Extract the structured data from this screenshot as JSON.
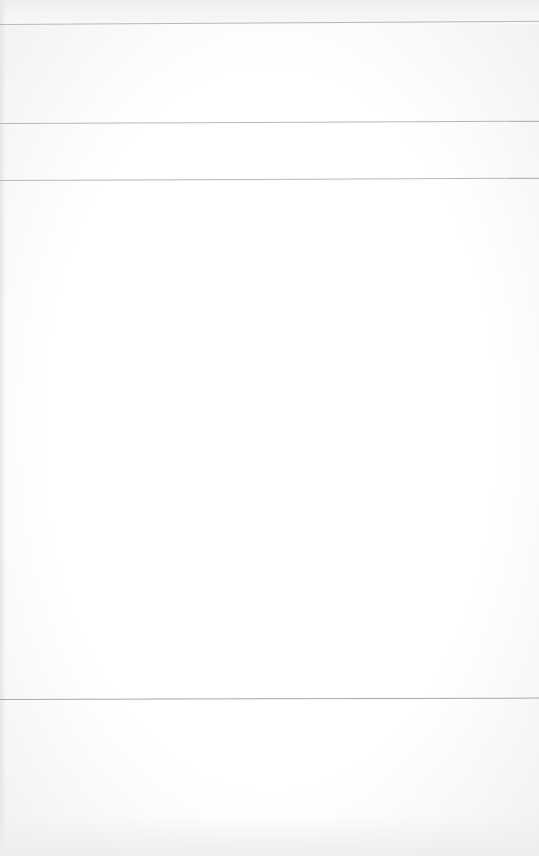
{
  "page": {
    "background_color": "#fafafa",
    "rule_color": "#b8b8b8",
    "visible_text": []
  }
}
